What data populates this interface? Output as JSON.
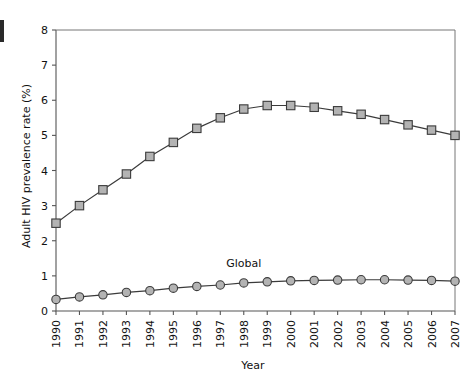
{
  "chart_data": {
    "type": "line",
    "title": "",
    "xlabel": "Year",
    "ylabel": "Adult HIV prevalence rate (%)",
    "xlim": [
      1990,
      2007
    ],
    "ylim": [
      0,
      8
    ],
    "ytick_step": 1,
    "grid": false,
    "legend_position": "inline-annotation",
    "x": [
      1990,
      1991,
      1992,
      1993,
      1994,
      1995,
      1996,
      1997,
      1998,
      1999,
      2000,
      2001,
      2002,
      2003,
      2004,
      2005,
      2006,
      2007
    ],
    "categories": [
      "1990",
      "1991",
      "1992",
      "1993",
      "1994",
      "1995",
      "1996",
      "1997",
      "1998",
      "1999",
      "2000",
      "2001",
      "2002",
      "2003",
      "2004",
      "2005",
      "2006",
      "2007"
    ],
    "yticks": [
      "0",
      "1",
      "2",
      "3",
      "4",
      "5",
      "6",
      "7",
      "8"
    ],
    "series": [
      {
        "name": "Sub-Saharan Africa",
        "marker": "square",
        "label_shown": false,
        "values": [
          2.5,
          3.0,
          3.45,
          3.9,
          4.4,
          4.8,
          5.2,
          5.5,
          5.75,
          5.85,
          5.85,
          5.8,
          5.7,
          5.6,
          5.45,
          5.3,
          5.15,
          5.0
        ]
      },
      {
        "name": "Global",
        "marker": "circle",
        "label_shown": true,
        "values": [
          0.33,
          0.4,
          0.46,
          0.53,
          0.58,
          0.65,
          0.7,
          0.74,
          0.8,
          0.83,
          0.86,
          0.87,
          0.88,
          0.89,
          0.89,
          0.88,
          0.87,
          0.85
        ]
      }
    ],
    "annotations": [
      {
        "text": "Global",
        "x": 1998,
        "y": 1.25
      }
    ],
    "colors": {
      "line": "#3b3b3b",
      "marker_fill": "#b3b3b3",
      "marker_stroke": "#3b3b3b",
      "axis": "#555555",
      "frame": "#777777",
      "text": "#111111",
      "background": "#ffffff"
    }
  }
}
